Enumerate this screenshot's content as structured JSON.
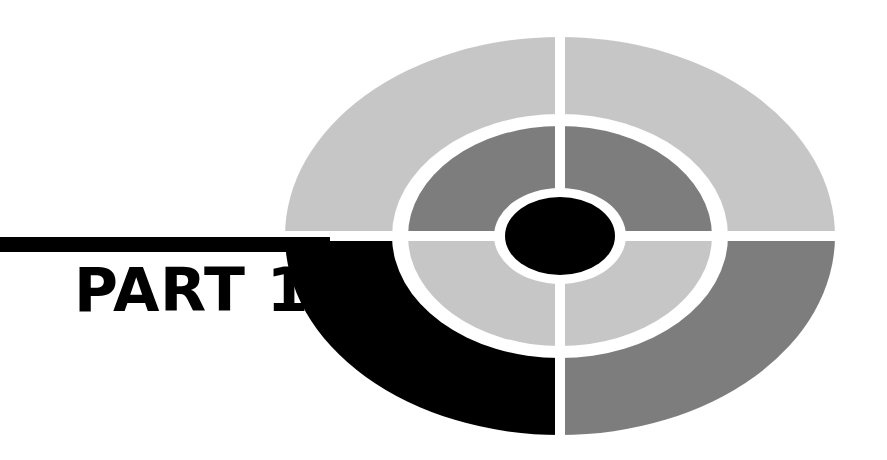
{
  "page": {
    "background_color": "#ffffff",
    "width": 887,
    "height": 460
  },
  "heading": {
    "label": "PART 1",
    "part_word": "PART",
    "part_number": "1",
    "color": "#000000"
  },
  "graphic": {
    "name": "concentric-target-ellipse",
    "description": "Bullseye target made of two concentric elliptical rings split into four quadrants by white cross gaps, with a solid black center ellipse",
    "center_x": 560,
    "center_y": 236,
    "outer_rx": 275,
    "outer_ry": 199,
    "ring_gap_color": "#ffffff",
    "rings": [
      {
        "name": "outer-ring",
        "rx": 275,
        "ry": 199,
        "inner_rx": 168,
        "inner_ry": 122,
        "quadrants": [
          {
            "name": "outer-top-left",
            "color": "#c6c6c6"
          },
          {
            "name": "outer-top-right",
            "color": "#c6c6c6"
          },
          {
            "name": "outer-bottom-right",
            "color": "#7d7d7d"
          },
          {
            "name": "outer-bottom-left",
            "color": "#000000"
          }
        ]
      },
      {
        "name": "inner-ring",
        "rx": 152,
        "ry": 110,
        "inner_rx": 66,
        "inner_ry": 48,
        "quadrants": [
          {
            "name": "inner-top-left",
            "color": "#7d7d7d"
          },
          {
            "name": "inner-top-right",
            "color": "#7d7d7d"
          },
          {
            "name": "inner-bottom-right",
            "color": "#c6c6c6"
          },
          {
            "name": "inner-bottom-left",
            "color": "#c6c6c6"
          }
        ]
      }
    ],
    "center": {
      "name": "center-ellipse",
      "rx": 55,
      "ry": 39,
      "color": "#000000"
    },
    "rule_bar": {
      "name": "horizontal-rule-bar",
      "color": "#000000",
      "x": 0,
      "y": 237,
      "width": 330,
      "height": 15
    }
  }
}
